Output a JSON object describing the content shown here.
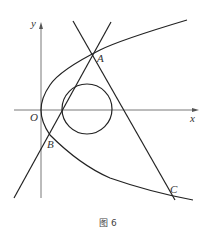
{
  "figure": {
    "caption": "图 6",
    "axes": {
      "x_label": "x",
      "y_label": "y",
      "origin_label": "O"
    },
    "points": {
      "A": "A",
      "B": "B",
      "C": "C"
    },
    "elements": [
      "parabola opening right with vertex at O",
      "circle tangent to two lines, centered on x-axis",
      "line through B and A",
      "line through A and C"
    ]
  }
}
